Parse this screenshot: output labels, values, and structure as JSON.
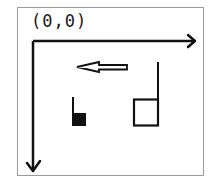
{
  "diagram": {
    "origin_label": "(0,0)",
    "axes": {
      "x_axis": {
        "direction": "right",
        "label": ""
      },
      "y_axis": {
        "direction": "down",
        "label": ""
      }
    },
    "elements": [
      {
        "id": "direction-arrow",
        "kind": "hollow-arrow",
        "points": "left"
      },
      {
        "id": "small-filled-square",
        "kind": "filled-square-with-stem",
        "stem_side": "left"
      },
      {
        "id": "hollow-square",
        "kind": "hollow-square-with-stem",
        "stem_side": "right"
      }
    ],
    "colors": {
      "stroke": "#111111",
      "frame": "#9a9a9a",
      "background": "#ffffff"
    }
  }
}
